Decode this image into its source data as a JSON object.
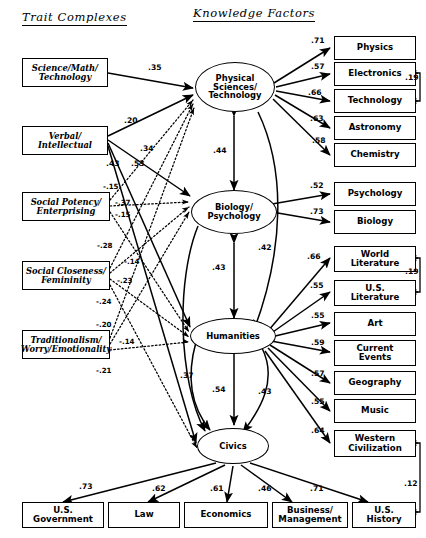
{
  "headers": {
    "left": "Trait Complexes",
    "right": "Knowledge Factors"
  },
  "trait_complexes": [
    {
      "id": "science_math_tech",
      "label": "Science/Math/ Technology",
      "line1": "Science/Math/",
      "line2": "Technology"
    },
    {
      "id": "verbal_intellectual",
      "label": "Verbal/ Intellectual",
      "line1": "Verbal/",
      "line2": "Intellectual"
    },
    {
      "id": "social_potency",
      "label": "Social Potency/ Enterprising",
      "line1": "Social Potency/",
      "line2": "Enterprising"
    },
    {
      "id": "social_closeness",
      "label": "Social Closeness/ Femininity",
      "line1": "Social Closeness/",
      "line2": "Femininity"
    },
    {
      "id": "traditionalism",
      "label": "Traditionalism/ Worry/Emotionality",
      "line1": "Traditionalism/",
      "line2": "Worry/Emotionality"
    }
  ],
  "latent_factors": [
    {
      "id": "physical_sciences",
      "line1": "Physical",
      "line2": "Sciences/",
      "line3": "Technology"
    },
    {
      "id": "biology_psychology",
      "line1": "Biology/",
      "line2": "Psychology",
      "line3": ""
    },
    {
      "id": "humanities",
      "line1": "Humanities",
      "line2": "",
      "line3": ""
    },
    {
      "id": "civics",
      "line1": "Civics",
      "line2": "",
      "line3": ""
    }
  ],
  "knowledge_factors": [
    {
      "id": "physics",
      "line1": "Physics",
      "line2": "",
      "underline": false
    },
    {
      "id": "electronics",
      "line1": "Electronics",
      "line2": "",
      "underline": false
    },
    {
      "id": "technology",
      "line1": "Technology",
      "line2": "",
      "underline": false
    },
    {
      "id": "astronomy",
      "line1": "Astronomy",
      "line2": "",
      "underline": false
    },
    {
      "id": "chemistry",
      "line1": "Chemistry",
      "line2": "",
      "underline": false
    },
    {
      "id": "psychology",
      "line1": "Psychology",
      "line2": "",
      "underline": false
    },
    {
      "id": "biology",
      "line1": "Biology",
      "line2": "",
      "underline": false
    },
    {
      "id": "world_literature",
      "line1": "World",
      "line2": "Literature",
      "underline": true
    },
    {
      "id": "us_literature",
      "line1": "U.S.",
      "line2": "Literature",
      "underline": true
    },
    {
      "id": "art",
      "line1": "Art",
      "line2": "",
      "underline": false
    },
    {
      "id": "current_events",
      "line1": "Current",
      "line2": "Events",
      "underline": false
    },
    {
      "id": "geography",
      "line1": "Geography",
      "line2": "",
      "underline": false
    },
    {
      "id": "music",
      "line1": "Music",
      "line2": "",
      "underline": false
    },
    {
      "id": "western_civilization",
      "line1": "Western",
      "line2": "Civilization",
      "underline": true
    },
    {
      "id": "us_government",
      "line1": "U.S.",
      "line2": "Government",
      "underline": true
    },
    {
      "id": "law",
      "line1": "Law",
      "line2": "",
      "underline": false
    },
    {
      "id": "economics",
      "line1": "Economics",
      "line2": "",
      "underline": false
    },
    {
      "id": "business_management",
      "line1": "Business/",
      "line2": "Management",
      "underline": true
    },
    {
      "id": "us_history",
      "line1": "U.S.",
      "line2": "History",
      "underline": true
    }
  ],
  "path_coefficients": {
    "trait_to_factor": [
      {
        "from": "science_math_tech",
        "to": "physical_sciences",
        "value": ".35",
        "style": "solid"
      },
      {
        "from": "verbal_intellectual",
        "to": "physical_sciences",
        "value": ".20",
        "style": "solid"
      },
      {
        "from": "verbal_intellectual",
        "to": "biology_psychology",
        "value": ".34",
        "style": "solid"
      },
      {
        "from": "verbal_intellectual",
        "to": "humanities",
        "value": ".53",
        "style": "solid"
      },
      {
        "from": "verbal_intellectual",
        "to": "civics",
        "value": ".43",
        "style": "solid"
      },
      {
        "from": "social_potency",
        "to": "physical_sciences",
        "value": "-.15",
        "style": "dotted"
      },
      {
        "from": "social_potency",
        "to": "biology_psychology",
        "value": "-.37",
        "style": "dotted"
      },
      {
        "from": "social_potency",
        "to": "humanities",
        "value": "-.15",
        "style": "dotted"
      },
      {
        "from": "social_closeness",
        "to": "physical_sciences",
        "value": "-.28",
        "style": "dotted"
      },
      {
        "from": "social_closeness",
        "to": "biology_psychology",
        "value": "-.14",
        "style": "dotted"
      },
      {
        "from": "social_closeness",
        "to": "humanities",
        "value": "-.23",
        "style": "dotted"
      },
      {
        "from": "social_closeness",
        "to": "civics",
        "value": "-.24",
        "style": "dotted"
      },
      {
        "from": "traditionalism",
        "to": "physical_sciences",
        "value": "-.20",
        "style": "dotted"
      },
      {
        "from": "traditionalism",
        "to": "biology_psychology",
        "value": "-.14",
        "style": "dotted"
      },
      {
        "from": "traditionalism",
        "to": "humanities",
        "value": "-.21",
        "style": "dotted"
      }
    ],
    "factor_to_factor": [
      {
        "from": "physical_sciences",
        "to": "biology_psychology",
        "value": ".44",
        "type": "double"
      },
      {
        "from": "physical_sciences",
        "to": "humanities",
        "value": ".42",
        "type": "double"
      },
      {
        "from": "biology_psychology",
        "to": "civics",
        "value": ".43",
        "type": "double"
      },
      {
        "from": "humanities",
        "to": "civics",
        "value": ".54",
        "type": "double"
      },
      {
        "from": "humanities",
        "to": "civics",
        "value": ".37",
        "type": "double"
      },
      {
        "from": "humanities",
        "to": "civics",
        "value": ".43",
        "type": "double"
      }
    ],
    "factor_to_indicator": [
      {
        "from": "physical_sciences",
        "to": "physics",
        "value": ".71"
      },
      {
        "from": "physical_sciences",
        "to": "electronics",
        "value": ".57"
      },
      {
        "from": "physical_sciences",
        "to": "technology",
        "value": ".66"
      },
      {
        "from": "physical_sciences",
        "to": "astronomy",
        "value": ".63"
      },
      {
        "from": "physical_sciences",
        "to": "chemistry",
        "value": ".58"
      },
      {
        "from": "biology_psychology",
        "to": "psychology",
        "value": ".52"
      },
      {
        "from": "biology_psychology",
        "to": "biology",
        "value": ".73"
      },
      {
        "from": "humanities",
        "to": "world_literature",
        "value": ".66"
      },
      {
        "from": "humanities",
        "to": "us_literature",
        "value": ".55"
      },
      {
        "from": "humanities",
        "to": "art",
        "value": ".55"
      },
      {
        "from": "humanities",
        "to": "current_events",
        "value": ".59"
      },
      {
        "from": "humanities",
        "to": "geography",
        "value": ".57"
      },
      {
        "from": "humanities",
        "to": "music",
        "value": ".55"
      },
      {
        "from": "humanities",
        "to": "western_civilization",
        "value": ".64"
      },
      {
        "from": "civics",
        "to": "us_government",
        "value": ".73"
      },
      {
        "from": "civics",
        "to": "law",
        "value": ".62"
      },
      {
        "from": "civics",
        "to": "economics",
        "value": ".61"
      },
      {
        "from": "civics",
        "to": "business_management",
        "value": ".46"
      },
      {
        "from": "civics",
        "to": "us_history",
        "value": ".71"
      }
    ],
    "residual_correlations": [
      {
        "between": [
          "electronics",
          "technology"
        ],
        "value": ".19"
      },
      {
        "between": [
          "world_literature",
          "us_literature"
        ],
        "value": ".19"
      },
      {
        "between": [
          "western_civilization",
          "us_history"
        ],
        "value": ".12"
      }
    ]
  }
}
